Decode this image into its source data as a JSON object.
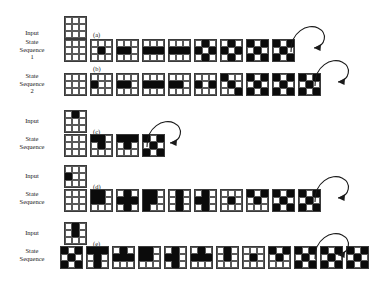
{
  "figure": {
    "background": "#ffffff",
    "ink": "#0b0b0b",
    "grid_line": "#5a5a5a",
    "cell_on_color": "#000000",
    "cell_off_color": "#ffffff"
  },
  "labels": {
    "input": "Input",
    "state_sequence_1": "State\nSequence\n1",
    "state_sequence_2": "State\nSequence\n2",
    "state_sequence": "State\nSequence"
  },
  "tags": {
    "a": "(a)",
    "b": "(b)",
    "c": "(c)",
    "d": "(d)",
    "e": "(e)"
  },
  "chart_data": {
    "type": "diagram",
    "title": "",
    "grid_size": [
      3,
      3
    ],
    "panels": [
      {
        "tag": "(a)",
        "input_label": "Input",
        "sequence_label": "State\nSequence\n1",
        "input": [
          [
            0,
            0,
            0
          ],
          [
            0,
            0,
            0
          ],
          [
            0,
            0,
            0
          ]
        ],
        "states": [
          [
            [
              0,
              0,
              0
            ],
            [
              0,
              0,
              0
            ],
            [
              0,
              0,
              0
            ]
          ],
          [
            [
              0,
              0,
              0
            ],
            [
              0,
              1,
              0
            ],
            [
              0,
              0,
              0
            ]
          ],
          [
            [
              0,
              0,
              0
            ],
            [
              1,
              1,
              0
            ],
            [
              0,
              0,
              0
            ]
          ],
          [
            [
              0,
              0,
              0
            ],
            [
              1,
              1,
              1
            ],
            [
              0,
              0,
              0
            ]
          ],
          [
            [
              0,
              0,
              0
            ],
            [
              1,
              1,
              1
            ],
            [
              0,
              0,
              0
            ]
          ],
          [
            [
              0,
              1,
              0
            ],
            [
              1,
              0,
              1
            ],
            [
              0,
              1,
              0
            ]
          ],
          [
            [
              0,
              1,
              0
            ],
            [
              1,
              0,
              1
            ],
            [
              0,
              1,
              0
            ]
          ],
          [
            [
              1,
              0,
              1
            ],
            [
              0,
              1,
              0
            ],
            [
              1,
              0,
              1
            ]
          ],
          [
            [
              1,
              0,
              1
            ],
            [
              0,
              1,
              0
            ],
            [
              1,
              0,
              1
            ]
          ]
        ],
        "loop": true,
        "loop_target_index": 8,
        "state_count": 9
      },
      {
        "tag": "(b)",
        "input_label": "",
        "sequence_label": "State\nSequence\n2",
        "input": null,
        "states": [
          [
            [
              0,
              0,
              0
            ],
            [
              0,
              0,
              0
            ],
            [
              0,
              0,
              0
            ]
          ],
          [
            [
              0,
              0,
              0
            ],
            [
              1,
              0,
              0
            ],
            [
              0,
              0,
              0
            ]
          ],
          [
            [
              0,
              0,
              0
            ],
            [
              1,
              1,
              0
            ],
            [
              0,
              0,
              0
            ]
          ],
          [
            [
              0,
              0,
              0
            ],
            [
              1,
              1,
              1
            ],
            [
              0,
              0,
              0
            ]
          ],
          [
            [
              0,
              0,
              0
            ],
            [
              1,
              1,
              0
            ],
            [
              0,
              0,
              0
            ]
          ],
          [
            [
              0,
              0,
              0
            ],
            [
              1,
              0,
              1
            ],
            [
              0,
              0,
              0
            ]
          ],
          [
            [
              1,
              0,
              0
            ],
            [
              0,
              1,
              0
            ],
            [
              0,
              0,
              1
            ]
          ],
          [
            [
              1,
              0,
              1
            ],
            [
              0,
              1,
              0
            ],
            [
              1,
              0,
              1
            ]
          ],
          [
            [
              1,
              0,
              1
            ],
            [
              0,
              1,
              0
            ],
            [
              1,
              0,
              1
            ]
          ],
          [
            [
              1,
              0,
              1
            ],
            [
              0,
              1,
              0
            ],
            [
              1,
              0,
              1
            ]
          ]
        ],
        "loop": true,
        "loop_target_index": 9,
        "state_count": 10
      },
      {
        "tag": "(c)",
        "input_label": "Input",
        "sequence_label": "State\nSequence",
        "input": [
          [
            0,
            1,
            0
          ],
          [
            0,
            0,
            0
          ],
          [
            0,
            0,
            0
          ]
        ],
        "states": [
          [
            [
              0,
              0,
              0
            ],
            [
              0,
              0,
              0
            ],
            [
              0,
              0,
              0
            ]
          ],
          [
            [
              1,
              1,
              0
            ],
            [
              0,
              1,
              0
            ],
            [
              0,
              0,
              0
            ]
          ],
          [
            [
              1,
              1,
              1
            ],
            [
              0,
              1,
              0
            ],
            [
              0,
              0,
              0
            ]
          ],
          [
            [
              1,
              0,
              1
            ],
            [
              0,
              1,
              0
            ],
            [
              1,
              0,
              1
            ]
          ]
        ],
        "loop": true,
        "loop_target_index": 3,
        "state_count": 4
      },
      {
        "tag": "(d)",
        "input_label": "Input",
        "sequence_label": "State\nSequence",
        "input": [
          [
            0,
            0,
            0
          ],
          [
            1,
            0,
            0
          ],
          [
            0,
            0,
            0
          ]
        ],
        "states": [
          [
            [
              0,
              0,
              0
            ],
            [
              0,
              0,
              0
            ],
            [
              0,
              0,
              0
            ]
          ],
          [
            [
              1,
              1,
              0
            ],
            [
              1,
              1,
              0
            ],
            [
              0,
              0,
              0
            ]
          ],
          [
            [
              0,
              1,
              0
            ],
            [
              1,
              1,
              1
            ],
            [
              0,
              1,
              0
            ]
          ],
          [
            [
              1,
              1,
              0
            ],
            [
              1,
              1,
              0
            ],
            [
              1,
              0,
              0
            ]
          ],
          [
            [
              0,
              1,
              0
            ],
            [
              0,
              1,
              0
            ],
            [
              0,
              1,
              0
            ]
          ],
          [
            [
              0,
              1,
              0
            ],
            [
              1,
              1,
              0
            ],
            [
              0,
              1,
              0
            ]
          ],
          [
            [
              0,
              0,
              0
            ],
            [
              0,
              1,
              0
            ],
            [
              0,
              0,
              0
            ]
          ],
          [
            [
              1,
              0,
              1
            ],
            [
              0,
              1,
              0
            ],
            [
              0,
              0,
              0
            ]
          ],
          [
            [
              1,
              0,
              1
            ],
            [
              0,
              1,
              0
            ],
            [
              1,
              0,
              1
            ]
          ],
          [
            [
              1,
              0,
              1
            ],
            [
              0,
              1,
              0
            ],
            [
              1,
              0,
              1
            ]
          ]
        ],
        "loop": true,
        "loop_target_index": 9,
        "state_count": 10
      },
      {
        "tag": "(e)",
        "input_label": "Input",
        "sequence_label": "State\nSequence",
        "input": [
          [
            0,
            1,
            0
          ],
          [
            0,
            1,
            0
          ],
          [
            0,
            0,
            0
          ]
        ],
        "states": [
          [
            [
              1,
              0,
              1
            ],
            [
              0,
              1,
              0
            ],
            [
              1,
              0,
              1
            ]
          ],
          [
            [
              1,
              1,
              1
            ],
            [
              0,
              1,
              0
            ],
            [
              0,
              1,
              0
            ]
          ],
          [
            [
              0,
              1,
              0
            ],
            [
              1,
              1,
              1
            ],
            [
              0,
              0,
              0
            ]
          ],
          [
            [
              1,
              1,
              0
            ],
            [
              1,
              1,
              0
            ],
            [
              0,
              0,
              0
            ]
          ],
          [
            [
              0,
              1,
              0
            ],
            [
              1,
              1,
              0
            ],
            [
              0,
              1,
              0
            ]
          ],
          [
            [
              0,
              1,
              0
            ],
            [
              1,
              1,
              1
            ],
            [
              0,
              0,
              0
            ]
          ],
          [
            [
              0,
              1,
              0
            ],
            [
              0,
              1,
              0
            ],
            [
              0,
              0,
              0
            ]
          ],
          [
            [
              0,
              0,
              0
            ],
            [
              0,
              1,
              0
            ],
            [
              0,
              0,
              0
            ]
          ],
          [
            [
              1,
              0,
              1
            ],
            [
              0,
              1,
              0
            ],
            [
              0,
              0,
              0
            ]
          ],
          [
            [
              1,
              0,
              1
            ],
            [
              0,
              1,
              0
            ],
            [
              1,
              0,
              1
            ]
          ],
          [
            [
              1,
              0,
              1
            ],
            [
              0,
              1,
              0
            ],
            [
              1,
              0,
              1
            ]
          ],
          [
            [
              1,
              0,
              1
            ],
            [
              0,
              1,
              0
            ],
            [
              1,
              0,
              1
            ]
          ]
        ],
        "loop": true,
        "loop_target_index": 11,
        "state_count": 12
      }
    ]
  }
}
